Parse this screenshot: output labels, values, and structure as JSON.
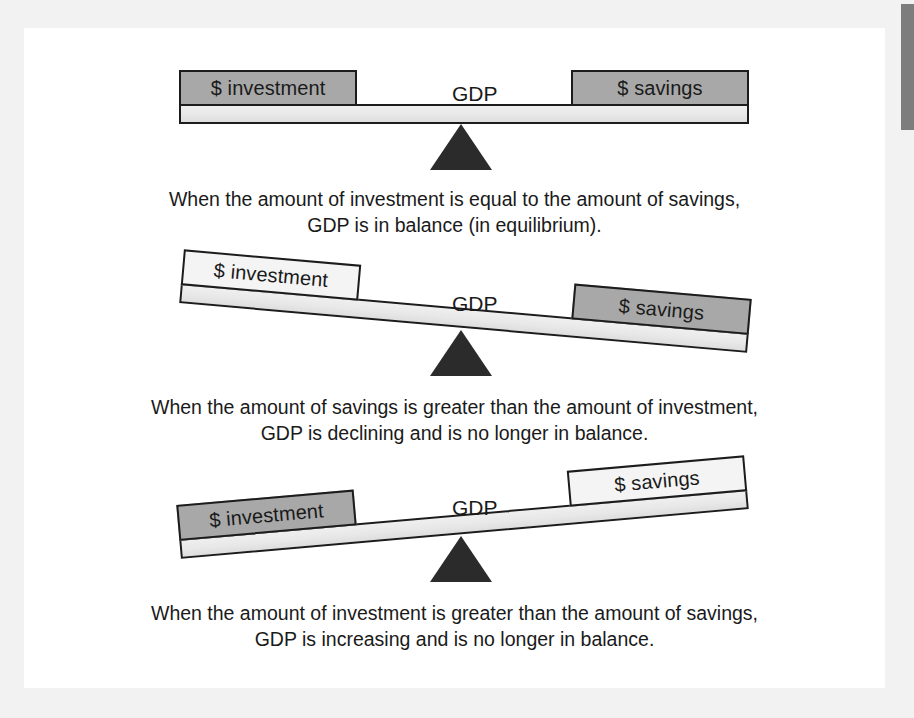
{
  "figure": {
    "colors": {
      "page_background": "#f2f2f2",
      "card_background": "#ffffff",
      "box_gray": "#a8a8a8",
      "box_light": "#f4f4f4",
      "beam_light": "#e8e8e8",
      "fulcrum_dark": "#2b2b2b",
      "outline": "#1c1c1c",
      "text": "#1a1a1a",
      "edge_strip": "#7d7d7d"
    },
    "scales": [
      {
        "id": "equilibrium",
        "tilt_degrees": 0,
        "left_label": "$ investment",
        "right_label": "$ savings",
        "center_label": "GDP",
        "left_fill": "gray",
        "right_fill": "gray",
        "caption_line1": "When the amount of investment is equal to the amount of savings,",
        "caption_line2": "GDP is in balance (in equilibrium)."
      },
      {
        "id": "declining",
        "tilt_degrees": 5,
        "left_label": "$ investment",
        "right_label": "$ savings",
        "center_label": "GDP",
        "left_fill": "light",
        "right_fill": "gray",
        "caption_line1": "When the amount of savings is greater than the amount of investment,",
        "caption_line2": "GDP is declining and is no longer in balance."
      },
      {
        "id": "increasing",
        "tilt_degrees": -5,
        "left_label": "$ investment",
        "right_label": "$ savings",
        "center_label": "GDP",
        "left_fill": "gray",
        "right_fill": "light",
        "caption_line1": "When the amount of investment is greater than the amount of savings,",
        "caption_line2": "GDP is increasing and is no longer in balance."
      }
    ]
  }
}
